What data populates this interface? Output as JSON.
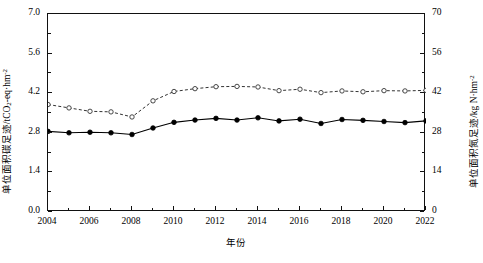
{
  "chart_data": {
    "type": "line",
    "title": "",
    "xlabel": "年份",
    "x": [
      2004,
      2005,
      2006,
      2007,
      2008,
      2009,
      2010,
      2011,
      2012,
      2013,
      2014,
      2015,
      2016,
      2017,
      2018,
      2019,
      2020,
      2021,
      2022
    ],
    "xlim": [
      2004,
      2022
    ],
    "xticks": [
      2004,
      2006,
      2008,
      2010,
      2012,
      2014,
      2016,
      2018,
      2020,
      2022
    ],
    "xticklabels": [
      "2004",
      "2006",
      "2008",
      "2010",
      "2012",
      "2014",
      "2016",
      "2018",
      "2020",
      "2022"
    ],
    "grid": false,
    "legend_position": "top-right",
    "axes": [
      {
        "id": "left",
        "label": "单位面积碳足迹/tCO₂-eq·hm⁻²",
        "label_main": "单位面积碳足迹/tCO",
        "label_sub": "2",
        "label_tail": "-eq·hm",
        "label_sup": "-2",
        "ylim": [
          0.0,
          7.0
        ],
        "yticks": [
          0.0,
          1.4,
          2.8,
          4.2,
          5.6,
          7.0
        ],
        "yticklabels": [
          "0.0",
          "1.4",
          "2.8",
          "4.2",
          "5.6",
          "7.0"
        ]
      },
      {
        "id": "right",
        "label": "单位面积氮足迹/kg N·hm⁻²",
        "label_main": "单位面积氮足迹/kg N·hm",
        "label_sup": "-2",
        "ylim": [
          0,
          70
        ],
        "yticks": [
          0,
          14,
          28,
          42,
          56,
          70
        ],
        "yticklabels": [
          "0",
          "14",
          "28",
          "42",
          "56",
          "70"
        ]
      }
    ],
    "series": [
      {
        "name": "单位面积碳足迹",
        "axis": "left",
        "linestyle": "solid",
        "marker": "filled-circle",
        "color": "#000000",
        "values": [
          2.85,
          2.8,
          2.82,
          2.8,
          2.74,
          2.97,
          3.17,
          3.25,
          3.31,
          3.25,
          3.33,
          3.22,
          3.28,
          3.13,
          3.27,
          3.24,
          3.2,
          3.16,
          3.22
        ]
      },
      {
        "name": "单位面积氮足迹",
        "axis": "right",
        "linestyle": "dashed",
        "marker": "open-circle",
        "color": "#333333",
        "values": [
          38.0,
          36.8,
          35.6,
          35.4,
          33.6,
          39.3,
          42.6,
          43.6,
          44.3,
          44.4,
          44.2,
          42.9,
          43.4,
          42.2,
          42.8,
          42.5,
          42.9,
          42.8,
          43.0
        ]
      }
    ]
  },
  "legend": {
    "items": [
      {
        "label": "单位面积碳足迹",
        "style": "solid-filled-marker"
      },
      {
        "label": "单位面积氮足迹",
        "style": "dashed-open-marker"
      }
    ]
  }
}
